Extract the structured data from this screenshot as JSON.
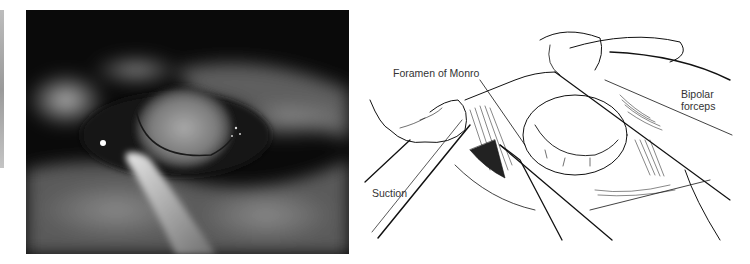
{
  "figure": {
    "left_panel": {
      "type": "endoscopic-photograph",
      "description": "Grayscale endoscopic view through the foramen of Monro with suction and bipolar instruments"
    },
    "right_panel": {
      "type": "line-illustration",
      "labels": {
        "foramen": "Foramen of Monro",
        "bipolar_line1": "Bipolar",
        "bipolar_line2": "forceps",
        "suction": "Suction"
      }
    }
  }
}
